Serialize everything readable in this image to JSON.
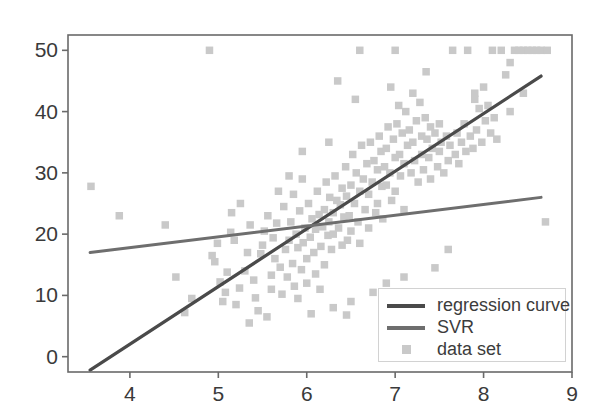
{
  "chart_data": {
    "type": "scatter",
    "title": "",
    "xlabel": "",
    "ylabel": "",
    "xlim": [
      3.3,
      9.0
    ],
    "ylim": [
      -2.5,
      52.5
    ],
    "grid": false,
    "xticks": [
      4,
      5,
      6,
      7,
      8,
      9
    ],
    "yticks": [
      0,
      10,
      20,
      30,
      40,
      50
    ],
    "xtick_labels": [
      "4",
      "5",
      "6",
      "7",
      "8",
      "9"
    ],
    "ytick_labels": [
      "0",
      "10",
      "20",
      "30",
      "40",
      "50"
    ],
    "legend": {
      "position": "lower right",
      "entries": [
        {
          "label": "regression curve",
          "type": "line",
          "color": "#4a4a4a"
        },
        {
          "label": "SVR",
          "type": "line",
          "color": "#6e6e6e"
        },
        {
          "label": "data set",
          "type": "marker",
          "color": "#c9c9c9"
        }
      ]
    },
    "series": [
      {
        "name": "regression curve",
        "type": "line",
        "color": "#4a4a4a",
        "linewidth": 3.2,
        "endpoints": [
          [
            3.55,
            -2.2
          ],
          [
            8.65,
            45.8
          ]
        ]
      },
      {
        "name": "SVR",
        "type": "line",
        "color": "#6e6e6e",
        "linewidth": 3.0,
        "endpoints": [
          [
            3.55,
            17.0
          ],
          [
            8.65,
            26.0
          ]
        ]
      },
      {
        "name": "data set",
        "type": "scatter",
        "color": "#c9c9c9",
        "marker": "square",
        "marker_size": 7.5,
        "points": [
          [
            3.56,
            27.8
          ],
          [
            3.88,
            23.0
          ],
          [
            4.4,
            21.5
          ],
          [
            4.52,
            13.0
          ],
          [
            4.9,
            50.0
          ],
          [
            4.93,
            16.5
          ],
          [
            4.96,
            15.5
          ],
          [
            4.99,
            18.5
          ],
          [
            5.02,
            12.2
          ],
          [
            5.05,
            9.0
          ],
          [
            5.08,
            10.5
          ],
          [
            5.1,
            13.8
          ],
          [
            5.14,
            20.3
          ],
          [
            5.18,
            19.0
          ],
          [
            5.2,
            8.5
          ],
          [
            5.24,
            11.2
          ],
          [
            5.3,
            14.0
          ],
          [
            5.33,
            17.0
          ],
          [
            5.36,
            21.5
          ],
          [
            5.4,
            12.5
          ],
          [
            5.42,
            9.6
          ],
          [
            5.45,
            7.5
          ],
          [
            5.48,
            16.8
          ],
          [
            5.5,
            18.2
          ],
          [
            5.52,
            20.5
          ],
          [
            5.56,
            23.0
          ],
          [
            5.6,
            13.3
          ],
          [
            5.6,
            11.0
          ],
          [
            5.62,
            19.4
          ],
          [
            5.64,
            16.0
          ],
          [
            5.66,
            21.8
          ],
          [
            5.7,
            14.6
          ],
          [
            5.72,
            10.2
          ],
          [
            5.74,
            24.5
          ],
          [
            5.76,
            17.5
          ],
          [
            5.78,
            13.0
          ],
          [
            5.8,
            19.0
          ],
          [
            5.82,
            22.0
          ],
          [
            5.84,
            15.2
          ],
          [
            5.85,
            26.5
          ],
          [
            5.86,
            11.5
          ],
          [
            5.88,
            20.0
          ],
          [
            5.9,
            17.8
          ],
          [
            5.9,
            9.5
          ],
          [
            5.92,
            23.8
          ],
          [
            5.94,
            14.2
          ],
          [
            5.95,
            29.0
          ],
          [
            5.96,
            18.6
          ],
          [
            5.98,
            21.0
          ],
          [
            6.0,
            16.0
          ],
          [
            6.0,
            12.0
          ],
          [
            6.02,
            25.0
          ],
          [
            6.04,
            19.5
          ],
          [
            6.06,
            22.5
          ],
          [
            6.08,
            17.0
          ],
          [
            6.1,
            20.8
          ],
          [
            6.1,
            13.5
          ],
          [
            6.12,
            27.0
          ],
          [
            6.14,
            23.2
          ],
          [
            6.16,
            18.0
          ],
          [
            6.18,
            21.2
          ],
          [
            6.2,
            24.0
          ],
          [
            6.2,
            15.0
          ],
          [
            6.22,
            28.5
          ],
          [
            6.24,
            19.8
          ],
          [
            6.25,
            22.0
          ],
          [
            6.26,
            26.0
          ],
          [
            6.28,
            17.5
          ],
          [
            6.3,
            23.5
          ],
          [
            6.3,
            20.0
          ],
          [
            6.32,
            29.5
          ],
          [
            6.34,
            25.5
          ],
          [
            6.36,
            21.0
          ],
          [
            6.38,
            24.8
          ],
          [
            6.4,
            18.2
          ],
          [
            6.4,
            27.5
          ],
          [
            6.42,
            22.8
          ],
          [
            6.44,
            31.0
          ],
          [
            6.45,
            26.2
          ],
          [
            6.46,
            19.0
          ],
          [
            6.48,
            23.0
          ],
          [
            6.5,
            28.0
          ],
          [
            6.5,
            20.5
          ],
          [
            6.52,
            33.0
          ],
          [
            6.54,
            25.0
          ],
          [
            6.56,
            30.0
          ],
          [
            6.58,
            22.0
          ],
          [
            6.6,
            27.0
          ],
          [
            6.6,
            18.5
          ],
          [
            6.62,
            34.5
          ],
          [
            6.64,
            29.0
          ],
          [
            6.66,
            24.0
          ],
          [
            6.68,
            31.5
          ],
          [
            6.7,
            26.5
          ],
          [
            6.7,
            21.0
          ],
          [
            6.72,
            35.0
          ],
          [
            6.74,
            28.5
          ],
          [
            6.76,
            32.0
          ],
          [
            6.78,
            23.5
          ],
          [
            6.8,
            30.5
          ],
          [
            6.8,
            25.0
          ],
          [
            6.82,
            36.0
          ],
          [
            6.84,
            33.5
          ],
          [
            6.85,
            27.8
          ],
          [
            6.86,
            22.5
          ],
          [
            6.88,
            31.0
          ],
          [
            6.9,
            34.0
          ],
          [
            6.9,
            28.0
          ],
          [
            6.92,
            37.5
          ],
          [
            6.94,
            30.0
          ],
          [
            6.96,
            25.5
          ],
          [
            6.98,
            35.5
          ],
          [
            7.0,
            32.5
          ],
          [
            7.0,
            27.0
          ],
          [
            7.02,
            38.0
          ],
          [
            7.04,
            41.0
          ],
          [
            7.05,
            33.0
          ],
          [
            7.06,
            29.5
          ],
          [
            7.08,
            36.5
          ],
          [
            7.1,
            31.5
          ],
          [
            7.1,
            24.0
          ],
          [
            7.12,
            40.0
          ],
          [
            7.14,
            34.5
          ],
          [
            7.16,
            37.0
          ],
          [
            7.18,
            30.0
          ],
          [
            7.2,
            43.0
          ],
          [
            7.2,
            35.0
          ],
          [
            7.22,
            32.0
          ],
          [
            7.24,
            38.5
          ],
          [
            7.26,
            28.5
          ],
          [
            7.28,
            41.5
          ],
          [
            7.3,
            36.0
          ],
          [
            7.3,
            33.0
          ],
          [
            7.32,
            30.5
          ],
          [
            7.34,
            39.0
          ],
          [
            7.36,
            35.5
          ],
          [
            7.38,
            32.5
          ],
          [
            7.4,
            37.5
          ],
          [
            7.4,
            29.0
          ],
          [
            7.42,
            34.0
          ],
          [
            7.45,
            36.5
          ],
          [
            7.48,
            31.0
          ],
          [
            7.5,
            38.0
          ],
          [
            7.5,
            33.5
          ],
          [
            7.52,
            35.0
          ],
          [
            7.55,
            30.0
          ],
          [
            7.58,
            36.0
          ],
          [
            7.6,
            32.0
          ],
          [
            7.62,
            34.5
          ],
          [
            7.65,
            50.0
          ],
          [
            7.68,
            33.0
          ],
          [
            7.7,
            36.5
          ],
          [
            7.72,
            31.5
          ],
          [
            7.75,
            35.0
          ],
          [
            7.78,
            38.0
          ],
          [
            7.8,
            33.5
          ],
          [
            7.82,
            50.0
          ],
          [
            7.85,
            36.0
          ],
          [
            7.88,
            34.0
          ],
          [
            7.9,
            43.0
          ],
          [
            7.9,
            42.0
          ],
          [
            7.92,
            37.0
          ],
          [
            7.95,
            40.5
          ],
          [
            7.98,
            35.0
          ],
          [
            8.0,
            44.0
          ],
          [
            8.02,
            38.5
          ],
          [
            8.05,
            41.0
          ],
          [
            8.08,
            36.5
          ],
          [
            8.1,
            50.0
          ],
          [
            8.12,
            39.0
          ],
          [
            8.15,
            35.5
          ],
          [
            8.2,
            50.0
          ],
          [
            8.25,
            46.0
          ],
          [
            8.3,
            48.0
          ],
          [
            8.35,
            50.0
          ],
          [
            8.4,
            50.0
          ],
          [
            8.45,
            50.0
          ],
          [
            8.5,
            50.0
          ],
          [
            8.55,
            50.0
          ],
          [
            8.6,
            50.0
          ],
          [
            8.65,
            50.0
          ],
          [
            8.7,
            22.0
          ],
          [
            8.72,
            50.0
          ],
          [
            6.6,
            50.0
          ],
          [
            7.0,
            50.0
          ],
          [
            6.25,
            35.0
          ],
          [
            5.95,
            33.5
          ],
          [
            7.45,
            14.5
          ],
          [
            7.6,
            17.5
          ],
          [
            6.3,
            8.0
          ],
          [
            6.5,
            9.0
          ],
          [
            6.75,
            10.5
          ],
          [
            6.9,
            12.0
          ],
          [
            7.1,
            13.0
          ],
          [
            5.55,
            6.5
          ],
          [
            6.05,
            7.0
          ],
          [
            6.45,
            6.8
          ],
          [
            5.35,
            5.5
          ],
          [
            6.15,
            11.0
          ],
          [
            4.7,
            9.5
          ],
          [
            5.15,
            23.5
          ],
          [
            5.25,
            25.0
          ],
          [
            4.62,
            7.2
          ],
          [
            6.35,
            45.0
          ],
          [
            6.95,
            44.0
          ],
          [
            7.35,
            46.5
          ],
          [
            6.55,
            42.0
          ],
          [
            5.8,
            29.5
          ],
          [
            5.68,
            27.0
          ],
          [
            8.45,
            43.0
          ],
          [
            8.3,
            40.0
          ]
        ]
      }
    ]
  },
  "axes": {
    "frame_color": "#6a6a6a",
    "background": "#ffffff"
  }
}
